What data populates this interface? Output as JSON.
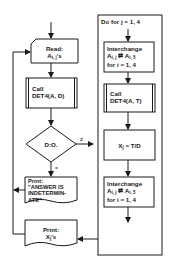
{
  "flowchart": {
    "read": {
      "line1": "Read:",
      "line2": "A",
      "sub": "i, j",
      "suffix": "'s"
    },
    "call_d": {
      "line1": "Call",
      "line2": "DET4(A, D)"
    },
    "decision": {
      "label": "D:O.",
      "ne_label": "≠",
      "eq_label": "="
    },
    "print_indet": {
      "line1": "Print:",
      "line2": "\"ANSWER IS",
      "line3": "INDETERMIN-",
      "line4": "ATE\""
    },
    "print_x": {
      "line1": "Print:",
      "line2": "X",
      "sub": "j",
      "suffix": "'s"
    },
    "loop": {
      "label": "Do for  j = 1, 4"
    },
    "interchange1": {
      "line1": "Interchange",
      "a1": "A",
      "s1": "i, j",
      "arrow": "⇄",
      "a2": "A",
      "s2": "i, 5",
      "line3": "for  i = 1, 4"
    },
    "call_t": {
      "line1": "Call",
      "line2": "DET4(A, T)"
    },
    "assign": {
      "x": "X",
      "sub": "j",
      "rest": " = T/D"
    },
    "interchange2": {
      "line1": "Interchange",
      "a1": "A",
      "s1": "i, j",
      "arrow": "⇄",
      "a2": "A",
      "s2": "i, 5",
      "line3": "for  i = 1, 4"
    }
  }
}
